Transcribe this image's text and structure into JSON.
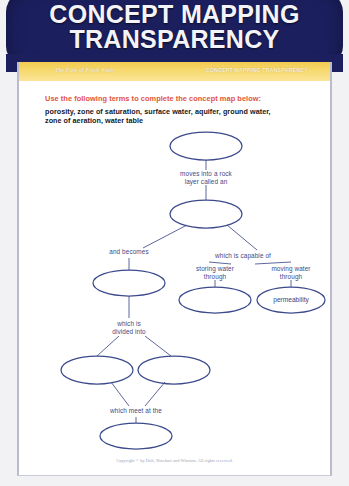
{
  "header": {
    "title_line1": "CONCEPT MAPPING",
    "title_line2": "TRANSPARENCY",
    "background_color": "#1b1f5e",
    "text_color": "#f4f4f8"
  },
  "running_head": {
    "left": "The Flow of Fresh Water",
    "right": "CONCEPT MAPPING TRANSPARENCY",
    "band_color": "#f7d96f"
  },
  "instructions": {
    "heading": "Use the following terms to complete the concept map below:",
    "heading_color": "#e2543c",
    "terms_line1": "porosity, zone of saturation, surface water, aquifer, ground water,",
    "terms_line2": "zone of aeration, water table"
  },
  "concept_map": {
    "ink_color": "#3c4a8c",
    "nodes": [
      {
        "id": "n1",
        "label": "",
        "cx": 187,
        "cy": 18,
        "rx": 36,
        "ry": 14
      },
      {
        "id": "n2",
        "label": "",
        "cx": 187,
        "cy": 86,
        "rx": 36,
        "ry": 14
      },
      {
        "id": "n3",
        "label": "",
        "cx": 110,
        "cy": 155,
        "rx": 36,
        "ry": 13
      },
      {
        "id": "n4",
        "label": "",
        "cx": 196,
        "cy": 172,
        "rx": 36,
        "ry": 13
      },
      {
        "id": "n5",
        "label": "permeability",
        "cx": 272,
        "cy": 172,
        "rx": 34,
        "ry": 13
      },
      {
        "id": "n6",
        "label": "",
        "cx": 78,
        "cy": 242,
        "rx": 36,
        "ry": 14
      },
      {
        "id": "n7",
        "label": "",
        "cx": 155,
        "cy": 242,
        "rx": 36,
        "ry": 14
      },
      {
        "id": "n8",
        "label": "",
        "cx": 117,
        "cy": 308,
        "rx": 36,
        "ry": 13
      }
    ],
    "link_labels": [
      {
        "id": "l1",
        "text_line1": "moves into a rock",
        "text_line2": "layer called an",
        "x": 187,
        "y": 48
      },
      {
        "id": "l2",
        "text_line1": "and becomes",
        "text_line2": "",
        "x": 110,
        "y": 126
      },
      {
        "id": "l3",
        "text_line1": "which is capable of",
        "text_line2": "",
        "x": 216,
        "y": 130
      },
      {
        "id": "l4",
        "text_line1": "storing water",
        "text_line2": "through",
        "x": 196,
        "y": 142
      },
      {
        "id": "l5",
        "text_line1": "moving water",
        "text_line2": "through",
        "x": 272,
        "y": 142
      },
      {
        "id": "l6",
        "text_line1": "which is",
        "text_line2": "divided into",
        "x": 110,
        "y": 198
      },
      {
        "id": "l7",
        "text_line1": "which meet at the",
        "text_line2": "",
        "x": 117,
        "y": 285
      }
    ]
  },
  "copyright": {
    "text": "Copyright © by Holt, Rinehart and Winston. All rights reserved."
  }
}
